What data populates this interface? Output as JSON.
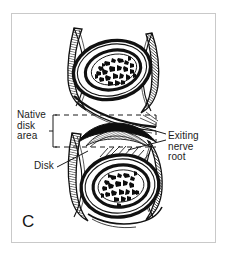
{
  "figure": {
    "panel_label": "C",
    "type": "anatomical-line-illustration",
    "ink_color": "#111111",
    "background_color": "#ffffff",
    "frame_color": "#c9c9c9"
  },
  "labels": {
    "native_disk_area": "Native\ndisk\narea",
    "disk": "Disk",
    "exiting_nerve_root": "Exiting\nnerve\nroot"
  },
  "annotations": {
    "bracket": {
      "name": "native-disk-area-bracket",
      "style": "square-bracket"
    },
    "dashed_top": {
      "name": "native-disk-area-top-dashed-line"
    },
    "dashed_bottom": {
      "name": "native-disk-area-bottom-dashed-line"
    },
    "dashed_vertical": {
      "name": "native-disk-area-right-dashed-line"
    },
    "leader_disk": {
      "name": "disk-leader-line"
    },
    "leader_nerve_upper": {
      "name": "exiting-nerve-root-leader-line-upper"
    },
    "leader_nerve_lower": {
      "name": "exiting-nerve-root-leader-line-lower"
    }
  },
  "illustration": {
    "upper_vertebra": {
      "name": "upper-vertebral-body",
      "core": "cancellous-bone-speckle"
    },
    "lower_vertebra": {
      "name": "lower-vertebral-body",
      "core": "cancellous-bone-speckle"
    },
    "disk_space": {
      "name": "intervertebral-disk-space"
    },
    "nerve_root": {
      "name": "exiting-nerve-root-structure"
    }
  }
}
